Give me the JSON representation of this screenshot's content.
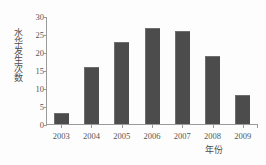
{
  "chart_data": {
    "type": "bar",
    "title": "",
    "xlabel": "年份",
    "ylabel": "水华发生次数",
    "categories": [
      "2003",
      "2004",
      "2005",
      "2006",
      "2007",
      "2008",
      "2009"
    ],
    "values": [
      3,
      16,
      23,
      27,
      26,
      19,
      8
    ],
    "ylim": [
      0,
      30
    ],
    "yticks": [
      "0",
      "5",
      "10",
      "15",
      "20",
      "25",
      "30"
    ],
    "ytick_values": [
      0,
      5,
      10,
      15,
      20,
      25,
      30
    ],
    "grid": false,
    "legend": null,
    "series": [
      {
        "name": "水华发生次数",
        "values": [
          3,
          16,
          23,
          27,
          26,
          19,
          8
        ]
      }
    ],
    "colors": {
      "bar_fill": "#4c4c4c",
      "bar_edge": "#6e6e6e",
      "axis": "#9a9a9a",
      "text": "#555555",
      "background": "#fdfdfd"
    }
  }
}
